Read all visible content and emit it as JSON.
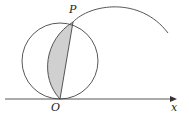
{
  "labels": {
    "point_p": "P",
    "point_o": "O",
    "axis_x": "x"
  },
  "colors": {
    "stroke": "#444444",
    "shade": "#d0d0d0",
    "background": "#ffffff"
  },
  "geometry": {
    "circle": {
      "cx": 60,
      "cy": 61,
      "r": 38
    },
    "origin": {
      "x": 60,
      "y": 99
    },
    "p": {
      "x": 73,
      "y": 22
    },
    "axis": {
      "x1": 5,
      "x2": 177,
      "y": 99
    }
  }
}
